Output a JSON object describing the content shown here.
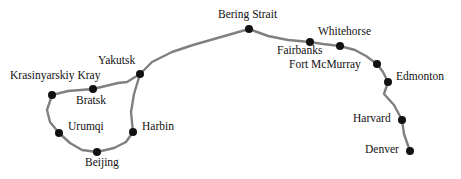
{
  "figure": {
    "type": "route-map",
    "background_color": "#ffffff",
    "route_color": "#808080",
    "node_color": "#111111",
    "label_color": "#111111",
    "route_width_px": 2.4,
    "node_radius_px": 4.2,
    "width": 461,
    "height": 179
  },
  "nodes": [
    {
      "name": "Krasinyarskiy Kray",
      "label": "Krasinyarskiy Kray",
      "x": 52,
      "y": 95,
      "label_x": 10,
      "label_y": 70,
      "label_anchor": "left"
    },
    {
      "name": "Bratsk",
      "label": "Bratsk",
      "x": 93,
      "y": 89,
      "label_x": 76,
      "label_y": 95,
      "label_anchor": "left"
    },
    {
      "name": "Yakutsk",
      "label": "Yakutsk",
      "x": 140,
      "y": 74,
      "label_x": 98,
      "label_y": 55,
      "label_anchor": "left"
    },
    {
      "name": "Urumqi",
      "label": "Urumqi",
      "x": 59,
      "y": 133,
      "label_x": 68,
      "label_y": 121,
      "label_anchor": "left"
    },
    {
      "name": "Harbin",
      "label": "Harbin",
      "x": 133,
      "y": 132,
      "label_x": 142,
      "label_y": 121,
      "label_anchor": "left"
    },
    {
      "name": "Beijing",
      "label": "Beijing",
      "x": 97,
      "y": 152,
      "label_x": 85,
      "label_y": 157,
      "label_anchor": "left"
    },
    {
      "name": "Bering Strait",
      "label": "Bering Strait",
      "x": 249,
      "y": 29,
      "label_x": 218,
      "label_y": 9,
      "label_anchor": "left"
    },
    {
      "name": "Fairbanks",
      "label": "Fairbanks",
      "x": 310,
      "y": 42,
      "label_x": 277,
      "label_y": 45,
      "label_anchor": "left"
    },
    {
      "name": "Whitehorse",
      "label": "Whitehorse",
      "x": 340,
      "y": 46,
      "label_x": 318,
      "label_y": 26,
      "label_anchor": "left"
    },
    {
      "name": "Fort McMurray",
      "label": "Fort McMurray",
      "x": 377,
      "y": 64,
      "label_x": 289,
      "label_y": 59,
      "label_anchor": "left"
    },
    {
      "name": "Edmonton",
      "label": "Edmonton",
      "x": 388,
      "y": 82,
      "label_x": 396,
      "label_y": 71,
      "label_anchor": "left"
    },
    {
      "name": "Harvard",
      "label": "Harvard",
      "x": 402,
      "y": 120,
      "label_x": 353,
      "label_y": 113,
      "label_anchor": "left"
    },
    {
      "name": "Denver",
      "label": "Denver",
      "x": 410,
      "y": 151,
      "label_x": 365,
      "label_y": 144,
      "label_anchor": "left"
    }
  ],
  "routes": [
    {
      "name": "krasinyarskiy-bratsk",
      "points": "52,95 68,91 93,89"
    },
    {
      "name": "bratsk-yakutsk",
      "points": "93,89 118,83 127,82 140,74"
    },
    {
      "name": "yakutsk-bering-strait",
      "points": "140,74 152,62 172,52 193,45 249,29"
    },
    {
      "name": "krasinyarskiy-urumqi",
      "points": "52,95 47,110 50,122 59,133"
    },
    {
      "name": "urumqi-beijing",
      "points": "59,133 70,143 82,150 97,152"
    },
    {
      "name": "beijing-harbin",
      "points": "97,152 114,148 126,142 133,132"
    },
    {
      "name": "harbin-yakutsk",
      "points": "133,132 131,112 134,94 140,74"
    },
    {
      "name": "bering-strait-fairbanks",
      "points": "249,29 268,36 288,40 310,42"
    },
    {
      "name": "fairbanks-whitehorse",
      "points": "310,42 323,44 340,46"
    },
    {
      "name": "whitehorse-fort-mcmurray",
      "points": "340,46 355,50 366,56 377,64"
    },
    {
      "name": "fort-mcmurray-edmonton",
      "points": "377,64 383,72 388,82"
    },
    {
      "name": "edmonton-harvard",
      "points": "388,82 384,94 394,105 402,120"
    },
    {
      "name": "harvard-denver",
      "points": "402,120 404,134 410,151"
    }
  ]
}
